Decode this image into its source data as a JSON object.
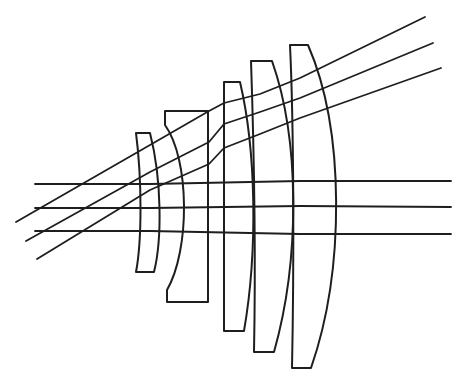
{
  "diagram": {
    "title": "Lens system ray-trace diagram",
    "stroke_color": "#1e1e1e",
    "background": "#ffffff",
    "lens_count": 6,
    "axial_ray_count": 3,
    "oblique_ray_count": 3
  },
  "lenses": [
    {
      "id": "lens-1",
      "path": "M136,133 L150,133 C162,180 162,240 154,272 L136,272 C142,240 142,180 136,133 Z"
    },
    {
      "id": "lens-2",
      "path": "M165,111 L208,111 L208,302 L167,302 L167,290 C190,250 190,160 165,125 Z"
    },
    {
      "id": "lens-3",
      "path": "M224,82 L240,82 C256,150 258,250 244,331 L224,331 Z"
    },
    {
      "id": "lens-4",
      "path": "M251,61 L272,61 C300,140 300,260 274,352 L254,352 C256,250 254,150 251,61 Z"
    },
    {
      "id": "lens-5",
      "path": "M290,45 L308,45 C345,130 345,270 311,368 L292,368 C294,270 294,130 290,45 Z"
    }
  ],
  "rays": {
    "axial": [
      {
        "id": "axial-1",
        "points": "35,184 150,184 300,181 451,181"
      },
      {
        "id": "axial-2",
        "points": "35,208 150,208 300,206 451,207"
      },
      {
        "id": "axial-3",
        "points": "35,231 150,231 300,234 451,234"
      }
    ],
    "oblique": [
      {
        "id": "oblique-1",
        "points": "16,222 150,145 209,111 224,103 260,94 300,78 425,17"
      },
      {
        "id": "oblique-2",
        "points": "26,241 150,172 209,142 224,124 260,112 300,98 433,43"
      },
      {
        "id": "oblique-3",
        "points": "37,259 150,190 209,164 224,148 260,134 300,118 441,68"
      }
    ]
  }
}
